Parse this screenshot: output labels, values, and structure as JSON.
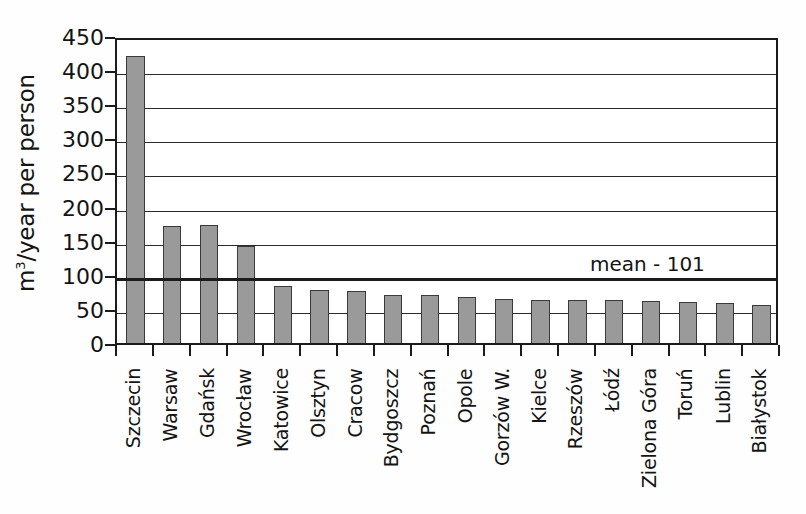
{
  "chart_data": {
    "type": "bar",
    "title": "",
    "subtitle": "",
    "xlabel": "",
    "ylabel": "m3/year per person",
    "ylabel_display": "m&sup3;/year per person",
    "ylim": [
      0,
      450
    ],
    "ytick_step": 50,
    "yticks": [
      0,
      50,
      100,
      150,
      200,
      250,
      300,
      350,
      400,
      450
    ],
    "grid": true,
    "grid_axis": "y",
    "legend": false,
    "legend_position": "none",
    "bar_color": "#9a9a9a",
    "bar_edge_color": "#3a3a3a",
    "axis_color": "#1b1b1b",
    "categories": [
      "Szczecin",
      "Warsaw",
      "Gdańsk",
      "Wrocław",
      "Katowice",
      "Olsztyn",
      "Cracow",
      "Bydgoszcz",
      "Poznań",
      "Opole",
      "Gorzów W.",
      "Kielce",
      "Rzeszów",
      "Łódź",
      "Zielona Góra",
      "Toruń",
      "Lublin",
      "Białystok"
    ],
    "values": [
      420,
      172,
      173,
      142,
      83,
      78,
      76,
      71,
      71,
      67,
      64,
      63,
      63,
      63,
      61,
      60,
      59,
      55
    ],
    "annotations": [
      {
        "name": "mean-line",
        "type": "hline",
        "value": 101,
        "label": "mean - 101",
        "color": "#1b1b1b"
      }
    ]
  },
  "axis": {
    "y_title": "m3/year per person",
    "y_title_prefix": "m",
    "y_title_superscript": "3",
    "y_title_suffix": "/year per person"
  }
}
